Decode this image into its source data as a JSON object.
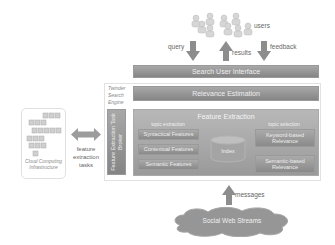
{
  "users": {
    "label": "users"
  },
  "flows": {
    "query": "query",
    "results": "results",
    "feedback": "feedback",
    "messages": "messages"
  },
  "search_ui": {
    "label": "Search User Interface"
  },
  "engine": {
    "title_line1": "Twinder",
    "title_line2": "Search",
    "title_line3": "Engine"
  },
  "relevance": {
    "label": "Relevance Estimation"
  },
  "broker": {
    "label": "Feature Extraction Task Broker"
  },
  "feature_extraction": {
    "title": "Feature Extraction",
    "left_group": {
      "label": "topic extraction",
      "items": [
        "Syntactical Features",
        "Contextual Features",
        "Semantic Features"
      ]
    },
    "index": "Index",
    "right_group": {
      "label": "topic selection",
      "items": [
        "Keyword-based Relevance",
        "Semantic-based Relevance"
      ]
    }
  },
  "cloud_infra": {
    "label": "Cloud Computing Infrastructure"
  },
  "tasks": {
    "line1": "feature",
    "line2": "extraction",
    "line3": "tasks"
  },
  "social": {
    "label": "Social Web Streams"
  },
  "colors": {
    "bar": "#8f8f8f",
    "box": "#a9a9a9",
    "text": "#666666"
  }
}
